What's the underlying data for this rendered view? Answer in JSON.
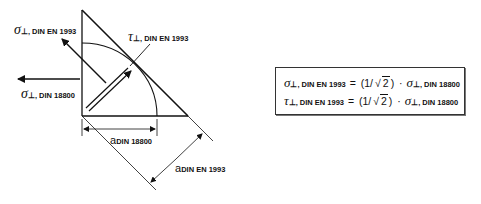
{
  "diagram": {
    "labels": {
      "sigma_en": {
        "symbol": "σ",
        "sub": "⊥, DIN EN 1993"
      },
      "tau_en": {
        "symbol": "τ",
        "sub": "⊥, DIN EN 1993"
      },
      "sigma_din": {
        "symbol": "σ",
        "sub": "⊥, DIN 18800"
      },
      "a_din": {
        "symbol": "a",
        "sub": "DIN 18800"
      },
      "a_en": {
        "symbol": "a",
        "sub": "DIN EN 1993"
      }
    }
  },
  "formulas": [
    {
      "lhs_symbol": "σ",
      "lhs_sub": "⊥, DIN EN 1993",
      "eq": " = ",
      "open": "(1/",
      "sqrt_sym": "√",
      "radicand": "2",
      "close": ")",
      "dot": " · ",
      "rhs_symbol": "σ",
      "rhs_sub": "⊥, DIN 18800"
    },
    {
      "lhs_symbol": "τ",
      "lhs_sub": "⊥, DIN EN 1993",
      "eq": " = ",
      "open": "(1/",
      "sqrt_sym": "√",
      "radicand": "2",
      "close": ")",
      "dot": " · ",
      "rhs_symbol": "σ",
      "rhs_sub": "⊥, DIN 18800"
    }
  ]
}
